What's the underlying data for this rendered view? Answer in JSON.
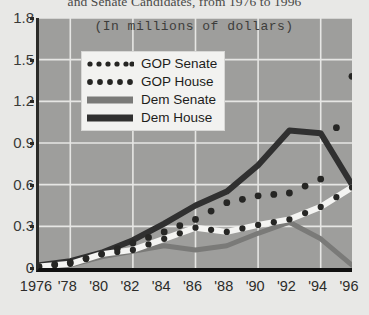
{
  "figure": {
    "cut_off_title": "and Senate Candidates, from 1976 to 1996",
    "subtitle": "(In millions of dollars)"
  },
  "legend": {
    "position": "upper-left-inside",
    "items": [
      {
        "label": "GOP Senate",
        "swatch": "white-line-with-dark-dots",
        "color": "#f4f4f2"
      },
      {
        "label": "GOP House",
        "swatch": "dark-dotted-line",
        "color": "#262624"
      },
      {
        "label": "Dem Senate",
        "swatch": "medium-gray-line",
        "color": "#7a7a78"
      },
      {
        "label": "Dem House",
        "swatch": "dark-solid-line",
        "color": "#303030"
      }
    ]
  },
  "chart_data": {
    "type": "line",
    "title": "and Senate Candidates, from 1976 to 1996",
    "subtitle": "(In millions of dollars)",
    "xlabel": "",
    "ylabel": "",
    "grid": true,
    "ylim": [
      0,
      1.8
    ],
    "yticks": [
      "0",
      "0.3",
      "0.6",
      "0.9",
      "1.2",
      "1.5",
      "1.8"
    ],
    "ytick_values": [
      0,
      0.3,
      0.6,
      0.9,
      1.2,
      1.5,
      1.8
    ],
    "categories": [
      "1976",
      "'78",
      "'80",
      "'82",
      "'84",
      "'86",
      "'88",
      "'90",
      "'92",
      "'94",
      "'96"
    ],
    "x": [
      1976,
      1978,
      1980,
      1982,
      1984,
      1986,
      1988,
      1990,
      1992,
      1994,
      1996
    ],
    "series": [
      {
        "name": "GOP Senate",
        "color": "#f4f4f2",
        "style": "white-line-with-dark-markers",
        "values": [
          0.01,
          0.03,
          0.1,
          0.13,
          0.21,
          0.29,
          0.26,
          0.31,
          0.35,
          0.44,
          0.58
        ]
      },
      {
        "name": "GOP House",
        "color": "#262624",
        "style": "dotted",
        "values": [
          0.01,
          0.04,
          0.1,
          0.18,
          0.26,
          0.35,
          0.47,
          0.52,
          0.54,
          0.64,
          1.38
        ]
      },
      {
        "name": "Dem Senate",
        "color": "#7a7a78",
        "style": "solid",
        "values": [
          0.01,
          0.02,
          0.08,
          0.12,
          0.16,
          0.13,
          0.16,
          0.25,
          0.33,
          0.21,
          0.02
        ]
      },
      {
        "name": "Dem House",
        "color": "#303030",
        "style": "solid-thick",
        "values": [
          0.02,
          0.05,
          0.11,
          0.2,
          0.32,
          0.45,
          0.55,
          0.74,
          0.99,
          0.97,
          0.6
        ]
      }
    ]
  }
}
